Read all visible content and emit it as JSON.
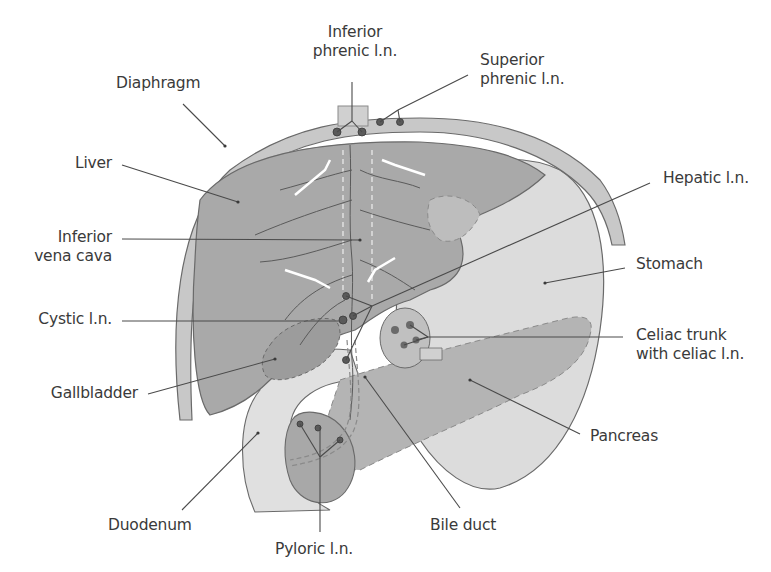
{
  "figure": {
    "labels": {
      "inferior_phrenic_ln": [
        "Inferior",
        "phrenic l.n."
      ],
      "superior_phrenic_ln": [
        "Superior",
        "phrenic l.n."
      ],
      "diaphragm": "Diaphragm",
      "liver": "Liver",
      "hepatic_ln": "Hepatic l.n.",
      "inferior_vena_cava": [
        "Inferior",
        "vena cava"
      ],
      "stomach": "Stomach",
      "cystic_ln": "Cystic l.n.",
      "celiac_trunk": [
        "Celiac trunk",
        "with celiac l.n."
      ],
      "gallbladder": "Gallbladder",
      "pancreas": "Pancreas",
      "duodenum": "Duodenum",
      "bile_duct": "Bile duct",
      "pyloric_ln": "Pyloric l.n."
    },
    "colors": {
      "liver_fill": "#a9a9a9",
      "liver_light": "#c4c4c4",
      "diaphragm_fill": "#c8c8c8",
      "stomach_fill": "#dedede",
      "pancreas_fill": "#b8b8b8",
      "gallbladder_fill": "#a0a0a0",
      "outline": "#6a6a6a",
      "leader_line": "#4a4a4a",
      "label_text": "#3a3a3a"
    }
  }
}
